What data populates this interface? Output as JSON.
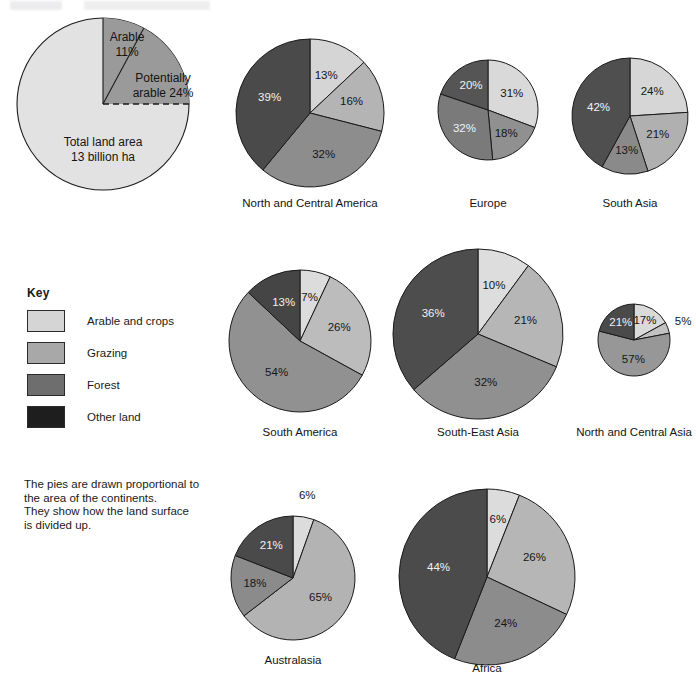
{
  "note": {
    "lines": [
      "The pies are drawn proportional to",
      "the area of the continents.",
      "They show how the land surface",
      "is divided up."
    ]
  },
  "key": {
    "title": "Key",
    "items": [
      {
        "label": "Arable and crops",
        "color": "#d5d5d5"
      },
      {
        "label": "Grazing",
        "color": "#a8a8a8"
      },
      {
        "label": "Forest",
        "color": "#6e6e6e"
      },
      {
        "label": "Other land",
        "color": "#1e1e1e"
      }
    ]
  },
  "colors": {
    "arable": "#d5d5d5",
    "grazing": "#a8a8a8",
    "forest": "#6e6e6e",
    "other": "#1e1e1e",
    "total_pie_base": "#e2e2e2",
    "total_pie_wedge": "#9a9a9a",
    "outline": "#1a1a1a"
  },
  "total_land_pie": {
    "center_label_line1": "Total land area",
    "center_label_line2": "13 billion ha",
    "arable_label_line1": "Arable",
    "arable_label_line2": "11%",
    "potential_label_line1": "Potentially",
    "potential_label_line2": "arable 24%",
    "arable_pct": 11,
    "potentially_arable_pct": 24,
    "cx": 103,
    "cy": 104,
    "r": 86
  },
  "chart_data": {
    "type": "pie",
    "note": "The pies are drawn proportional to the area of the continents. They show how the land surface is divided up.",
    "legend": [
      "Arable and crops",
      "Grazing",
      "Forest",
      "Other land"
    ],
    "legend_position": "left",
    "units": "percent",
    "charts": [
      {
        "name": "North and Central America",
        "caption": "North and Central America",
        "cx": 310,
        "cy": 113,
        "r": 74,
        "caption_y": 207,
        "slices": [
          {
            "category": "Arable and crops",
            "value": 13,
            "color": "#d5d5d5",
            "label": "13%",
            "label_r": 0.55,
            "dark_text": false
          },
          {
            "category": "Grazing",
            "value": 16,
            "color": "#b4b4b4",
            "label": "16%",
            "label_r": 0.58,
            "dark_text": false
          },
          {
            "category": "Forest",
            "value": 32,
            "color": "#8d8d8d",
            "label": "32%",
            "label_r": 0.6,
            "dark_text": false
          },
          {
            "category": "Other land",
            "value": 39,
            "color": "#4a4a4a",
            "label": "39%",
            "label_r": 0.58,
            "dark_text": true
          }
        ]
      },
      {
        "name": "Europe",
        "caption": "Europe",
        "cx": 488,
        "cy": 110,
        "r": 50,
        "caption_y": 207,
        "slices": [
          {
            "category": "Arable and crops",
            "value": 31,
            "color": "#d9d9d9",
            "label": "31%",
            "label_r": 0.58,
            "dark_text": false
          },
          {
            "category": "Grazing",
            "value": 18,
            "color": "#909090",
            "label": "18%",
            "label_r": 0.6,
            "dark_text": false
          },
          {
            "category": "Forest",
            "value": 32,
            "color": "#7a7a7a",
            "label": "32%",
            "label_r": 0.6,
            "dark_text": true
          },
          {
            "category": "Other land",
            "value": 20,
            "color": "#555555",
            "label": "20%",
            "label_r": 0.58,
            "dark_text": true
          }
        ]
      },
      {
        "name": "South Asia",
        "caption": "South Asia",
        "cx": 630,
        "cy": 116,
        "r": 58,
        "caption_y": 207,
        "slices": [
          {
            "category": "Arable and crops",
            "value": 24,
            "color": "#d6d6d6",
            "label": "24%",
            "label_r": 0.56,
            "dark_text": false
          },
          {
            "category": "Grazing",
            "value": 21,
            "color": "#b0b0b0",
            "label": "21%",
            "label_r": 0.58,
            "dark_text": false
          },
          {
            "category": "Forest",
            "value": 13,
            "color": "#8a8a8a",
            "label": "13%",
            "label_r": 0.6,
            "dark_text": false
          },
          {
            "category": "Other land",
            "value": 42,
            "color": "#4f4f4f",
            "label": "42%",
            "label_r": 0.56,
            "dark_text": true
          }
        ]
      },
      {
        "name": "South America",
        "caption": "South America",
        "cx": 300,
        "cy": 341,
        "r": 71,
        "caption_y": 436,
        "slices": [
          {
            "category": "Arable and crops",
            "value": 7,
            "color": "#dcdcdc",
            "label": "7%",
            "label_r": 0.62,
            "dark_text": false
          },
          {
            "category": "Grazing",
            "value": 26,
            "color": "#bcbcbc",
            "label": "26%",
            "label_r": 0.58,
            "dark_text": false
          },
          {
            "category": "Forest",
            "value": 54,
            "color": "#919191",
            "label": "54%",
            "label_r": 0.56,
            "dark_text": false
          },
          {
            "category": "Other land",
            "value": 13,
            "color": "#454545",
            "label": "13%",
            "label_r": 0.58,
            "dark_text": true
          }
        ]
      },
      {
        "name": "South-East Asia",
        "caption": "South-East Asia",
        "cx": 478,
        "cy": 334,
        "r": 85,
        "caption_y": 436,
        "slices": [
          {
            "category": "Arable and crops",
            "value": 10,
            "color": "#dddddd",
            "label": "10%",
            "label_r": 0.6,
            "dark_text": false
          },
          {
            "category": "Grazing",
            "value": 21,
            "color": "#b6b6b6",
            "label": "21%",
            "label_r": 0.58,
            "dark_text": false
          },
          {
            "category": "Forest",
            "value": 32,
            "color": "#909090",
            "label": "32%",
            "label_r": 0.58,
            "dark_text": false
          },
          {
            "category": "Other land",
            "value": 36,
            "color": "#4d4d4d",
            "label": "36%",
            "label_r": 0.58,
            "dark_text": true
          }
        ]
      },
      {
        "name": "North and Central Asia",
        "caption": "North and Central Asia",
        "cx": 634,
        "cy": 340,
        "r": 36,
        "caption_y": 436,
        "slices": [
          {
            "category": "Arable and crops",
            "value": 17,
            "color": "#dadada",
            "label": "17%",
            "label_r": 0.6,
            "dark_text": false
          },
          {
            "category": "Grazing",
            "value": 5,
            "color": "#c2c2c2",
            "label": "5%",
            "label_r": 1.45,
            "dark_text": false
          },
          {
            "category": "Forest",
            "value": 57,
            "color": "#979797",
            "label": "57%",
            "label_r": 0.55,
            "dark_text": false
          },
          {
            "category": "Other land",
            "value": 21,
            "color": "#4a4a4a",
            "label": "21%",
            "label_r": 0.6,
            "dark_text": true
          }
        ]
      },
      {
        "name": "Australasia",
        "caption": "Australasia",
        "cx": 293,
        "cy": 578,
        "r": 62,
        "caption_y": 664,
        "slices": [
          {
            "category": "Arable and crops",
            "value": 6,
            "color": "#dcdcdc",
            "label": "6%",
            "label_r": 1.35,
            "dark_text": false
          },
          {
            "category": "Grazing",
            "value": 65,
            "color": "#b3b3b3",
            "label": "65%",
            "label_r": 0.55,
            "dark_text": false
          },
          {
            "category": "Forest",
            "value": 18,
            "color": "#8b8b8b",
            "label": "18%",
            "label_r": 0.62,
            "dark_text": false
          },
          {
            "category": "Other land",
            "value": 21,
            "color": "#4a4a4a",
            "label": "21%",
            "label_r": 0.62,
            "dark_text": true
          }
        ]
      },
      {
        "name": "Africa",
        "caption": "Africa",
        "cx": 487,
        "cy": 577,
        "r": 88,
        "caption_y": 672,
        "slices": [
          {
            "category": "Arable and crops",
            "value": 6,
            "color": "#dcdcdc",
            "label": "6%",
            "label_r": 0.66,
            "dark_text": false
          },
          {
            "category": "Grazing",
            "value": 26,
            "color": "#b6b6b6",
            "label": "26%",
            "label_r": 0.58,
            "dark_text": false
          },
          {
            "category": "Forest",
            "value": 24,
            "color": "#8c8c8c",
            "label": "24%",
            "label_r": 0.58,
            "dark_text": false
          },
          {
            "category": "Other land",
            "value": 44,
            "color": "#4b4b4b",
            "label": "44%",
            "label_r": 0.56,
            "dark_text": true
          }
        ]
      }
    ]
  }
}
